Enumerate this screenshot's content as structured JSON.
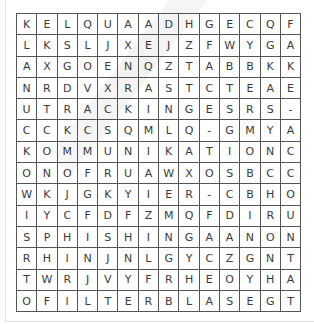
{
  "puzzle": {
    "type": "word-search",
    "rows": 14,
    "cols": 14,
    "grid": [
      [
        "K",
        "E",
        "L",
        "Q",
        "U",
        "A",
        "A",
        "D",
        "H",
        "G",
        "E",
        "C",
        "Q",
        "F"
      ],
      [
        "L",
        "K",
        "S",
        "L",
        "J",
        "X",
        "E",
        "J",
        "Z",
        "F",
        "W",
        "Y",
        "G",
        "A"
      ],
      [
        "A",
        "X",
        "G",
        "O",
        "E",
        "N",
        "Q",
        "Z",
        "T",
        "A",
        "B",
        "B",
        "K",
        "K"
      ],
      [
        "N",
        "R",
        "D",
        "V",
        "X",
        "R",
        "A",
        "S",
        "T",
        "C",
        "T",
        "E",
        "A",
        "E"
      ],
      [
        "U",
        "T",
        "R",
        "A",
        "C",
        "K",
        "I",
        "N",
        "G",
        "E",
        "S",
        "R",
        "S",
        "-"
      ],
      [
        "C",
        "C",
        "K",
        "C",
        "S",
        "Q",
        "M",
        "L",
        "Q",
        "-",
        "G",
        "M",
        "Y",
        "A"
      ],
      [
        "K",
        "O",
        "M",
        "M",
        "U",
        "N",
        "I",
        "K",
        "A",
        "T",
        "I",
        "O",
        "N",
        "C"
      ],
      [
        "O",
        "N",
        "O",
        "F",
        "R",
        "U",
        "A",
        "W",
        "X",
        "O",
        "S",
        "B",
        "C",
        "C"
      ],
      [
        "W",
        "K",
        "J",
        "G",
        "K",
        "Y",
        "I",
        "E",
        "R",
        "-",
        "C",
        "B",
        "H",
        "O"
      ],
      [
        "I",
        "Y",
        "C",
        "F",
        "D",
        "F",
        "Z",
        "M",
        "Q",
        "F",
        "D",
        "I",
        "R",
        "U"
      ],
      [
        "S",
        "P",
        "H",
        "I",
        "S",
        "H",
        "I",
        "N",
        "G",
        "A",
        "A",
        "N",
        "O",
        "N"
      ],
      [
        "R",
        "H",
        "I",
        "N",
        "J",
        "N",
        "L",
        "G",
        "Y",
        "C",
        "Z",
        "G",
        "N",
        "T"
      ],
      [
        "T",
        "W",
        "R",
        "J",
        "V",
        "Y",
        "F",
        "R",
        "H",
        "E",
        "O",
        "Y",
        "H",
        "A"
      ],
      [
        "O",
        "F",
        "I",
        "L",
        "T",
        "E",
        "R",
        "B",
        "L",
        "A",
        "S",
        "E",
        "G",
        "T"
      ]
    ]
  },
  "colors": {
    "grid_line": "#555555",
    "letter": "#3a3a3a",
    "panel_border": "#e4e4e4",
    "background": "#ffffff"
  }
}
